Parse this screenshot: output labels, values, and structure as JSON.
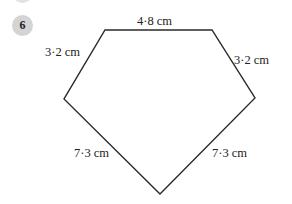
{
  "question": {
    "number": "6"
  },
  "shape": {
    "type": "pentagon",
    "stroke_color": "#2a2a2a",
    "vertices": [
      [
        105,
        30
      ],
      [
        212,
        30
      ],
      [
        255,
        98
      ],
      [
        160,
        194
      ],
      [
        64,
        99
      ]
    ],
    "sides": [
      {
        "label": "4·8 cm"
      },
      {
        "label": "3·2 cm"
      },
      {
        "label": "7·3 cm"
      },
      {
        "label": "7·3 cm"
      },
      {
        "label": "3·2 cm"
      }
    ]
  }
}
